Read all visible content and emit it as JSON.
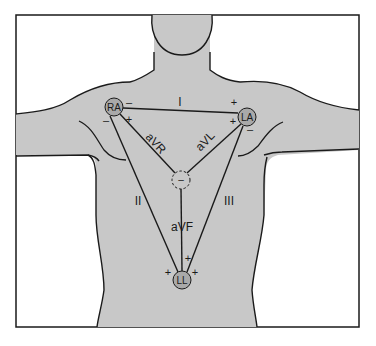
{
  "diagram": {
    "colors": {
      "background": "#ffffff",
      "body_fill": "#c8c8c8",
      "electrode_fill": "#a9a9a9",
      "line": "#1a1a1a"
    },
    "electrodes": [
      {
        "id": "RA",
        "label": "RA",
        "cx": 114,
        "cy": 107
      },
      {
        "id": "LA",
        "label": "LA",
        "cx": 247,
        "cy": 117
      },
      {
        "id": "LL",
        "label": "LL",
        "cx": 182,
        "cy": 280
      },
      {
        "id": "center",
        "label": "–",
        "cx": 181,
        "cy": 180
      }
    ],
    "leads": {
      "I": "I",
      "II": "II",
      "III": "III",
      "aVR": "aVR",
      "aVL": "aVL",
      "aVF": "aVF"
    },
    "polarity": {
      "ra_neg_lead_I": "–",
      "la_pos_lead_I": "+",
      "ra_pos_avr": "+",
      "ra_neg_lead_II": "–",
      "la_pos_avl": "+",
      "la_neg_lead_III": "–",
      "ll_pos_lead_II": "+",
      "ll_pos_lead_III": "+",
      "ll_pos_avf": "+"
    }
  }
}
